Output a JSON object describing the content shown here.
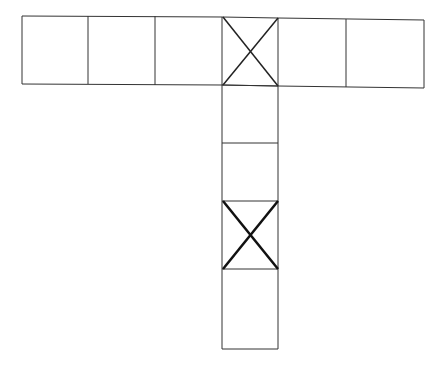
{
  "diagram": {
    "type": "cube-net",
    "top_row": {
      "count": 6,
      "marked_index": 3
    },
    "column": {
      "count": 4,
      "marked_index": 2
    },
    "stroke_color": "#333333",
    "background": "#ffffff"
  }
}
